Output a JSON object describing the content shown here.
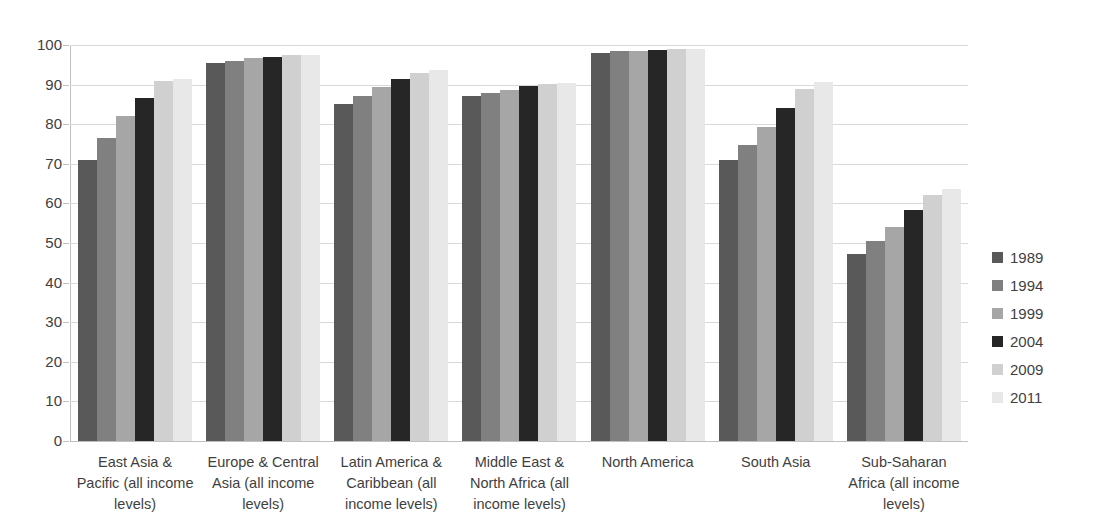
{
  "chart_data": {
    "type": "bar",
    "title": "",
    "subtitle": "",
    "xlabel": "",
    "ylabel": "",
    "ylim": [
      0,
      100
    ],
    "ytick_step": 10,
    "yticks": [
      "100",
      "90",
      "80",
      "70",
      "60",
      "50",
      "40",
      "30",
      "20",
      "10",
      "0"
    ],
    "grid": true,
    "legend_position": "right",
    "categories": [
      "East Asia & Pacific (all income levels)",
      "Europe & Central Asia (all income levels)",
      "Latin America & Caribbean (all income levels)",
      "Middle East & North Africa (all income levels)",
      "North America",
      "South Asia",
      "Sub-Saharan Africa (all income levels)"
    ],
    "series": [
      {
        "name": "1989",
        "color": "#595959",
        "values": [
          71.0,
          95.5,
          85.0,
          87.2,
          98.0,
          71.0,
          47.2
        ]
      },
      {
        "name": "1994",
        "color": "#808080",
        "values": [
          76.5,
          96.0,
          87.2,
          88.0,
          98.5,
          74.8,
          50.4
        ]
      },
      {
        "name": "1999",
        "color": "#a6a6a6",
        "values": [
          82.0,
          96.6,
          89.5,
          88.6,
          98.6,
          79.4,
          54.1
        ]
      },
      {
        "name": "2004",
        "color": "#262626",
        "values": [
          86.7,
          97.0,
          91.5,
          89.6,
          98.8,
          84.1,
          58.4
        ]
      },
      {
        "name": "2009",
        "color": "#d0d0d0",
        "values": [
          91.0,
          97.6,
          93.0,
          90.2,
          99.0,
          88.8,
          62.1
        ]
      },
      {
        "name": "2011",
        "color": "#e8e8e8",
        "values": [
          91.5,
          97.6,
          93.6,
          90.4,
          99.0,
          90.6,
          63.6
        ]
      }
    ]
  }
}
